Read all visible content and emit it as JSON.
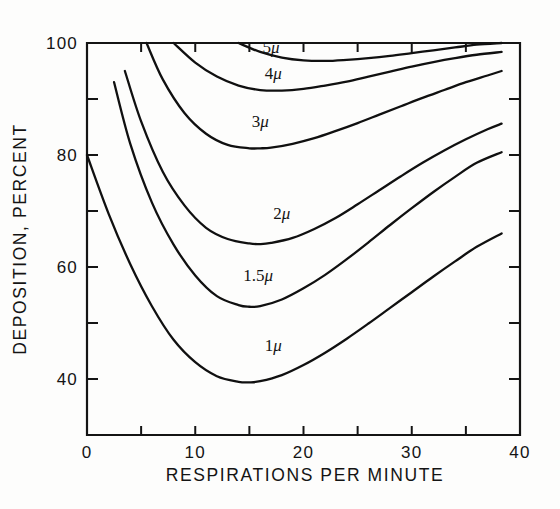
{
  "chart_data": {
    "type": "line",
    "title": "",
    "xlabel": "RESPIRATIONS PER MINUTE",
    "ylabel": "DEPOSITION, PERCENT",
    "xlim": [
      0,
      40
    ],
    "ylim": [
      30,
      100
    ],
    "grid": false,
    "legend_position": "inline-curve-labels",
    "x_major_ticks": [
      0,
      10,
      20,
      30,
      40
    ],
    "x_minor_ticks": [
      5,
      15,
      25,
      35
    ],
    "x_tick_labels": [
      "0",
      "10",
      "20",
      "30",
      "40"
    ],
    "y_major_ticks": [
      40,
      60,
      80,
      100
    ],
    "y_minor_ticks": [
      50,
      70,
      90
    ],
    "y_tick_labels": [
      "40",
      "60",
      "80",
      "100"
    ],
    "series": [
      {
        "name": "1μ",
        "label": "1",
        "unit": "μ",
        "label_x": 17.2,
        "label_y": 45.0,
        "x": [
          0,
          2,
          4,
          6,
          8,
          10,
          12,
          14,
          15,
          16,
          18,
          20,
          22,
          24,
          26,
          28,
          30,
          32,
          34,
          36,
          38.3
        ],
        "y": [
          80.0,
          69.5,
          60.5,
          53.0,
          47.0,
          43.0,
          40.5,
          39.5,
          39.4,
          39.6,
          40.7,
          42.5,
          44.7,
          47.2,
          49.9,
          52.7,
          55.5,
          58.3,
          61.0,
          63.6,
          66.0
        ]
      },
      {
        "name": "1.5μ",
        "label": "1.5",
        "unit": "μ",
        "label_x": 15.8,
        "label_y": 57.5,
        "x": [
          2.5,
          4,
          6,
          8,
          10,
          12,
          14,
          15,
          16,
          18,
          20,
          22,
          24,
          26,
          28,
          30,
          32,
          34,
          36,
          38.3
        ],
        "y": [
          93.0,
          82.0,
          71.5,
          64.0,
          58.5,
          54.8,
          53.2,
          52.9,
          53.0,
          54.2,
          56.2,
          58.6,
          61.4,
          64.4,
          67.5,
          70.5,
          73.4,
          76.1,
          78.6,
          80.5
        ]
      },
      {
        "name": "2μ",
        "label": "2",
        "unit": "μ",
        "label_x": 18.0,
        "label_y": 68.5,
        "x": [
          3.5,
          5,
          7,
          9,
          11,
          13,
          15,
          16,
          17,
          19,
          21,
          23,
          25,
          27,
          29,
          31,
          33,
          35,
          37,
          38.3
        ],
        "y": [
          95.0,
          86.0,
          77.0,
          71.0,
          67.0,
          65.0,
          64.2,
          64.1,
          64.3,
          65.2,
          66.8,
          68.8,
          71.2,
          73.7,
          76.2,
          78.6,
          80.8,
          82.8,
          84.6,
          85.6
        ]
      },
      {
        "name": "3μ",
        "label": "3",
        "unit": "μ",
        "label_x": 16.0,
        "label_y": 85.0,
        "x": [
          5.5,
          7,
          9,
          11,
          13,
          15,
          16,
          17,
          19,
          21,
          23,
          25,
          27,
          29,
          31,
          33,
          35,
          37,
          38.3
        ],
        "y": [
          100.0,
          93.5,
          87.5,
          83.8,
          81.8,
          81.2,
          81.2,
          81.3,
          82.0,
          83.0,
          84.3,
          85.7,
          87.2,
          88.7,
          90.2,
          91.6,
          93.0,
          94.2,
          95.0
        ]
      },
      {
        "name": "4μ",
        "label": "4",
        "unit": "μ",
        "label_x": 17.2,
        "label_y": 93.5,
        "x": [
          8,
          10,
          12,
          14,
          16,
          18,
          20,
          22,
          24,
          26,
          28,
          30,
          32,
          34,
          36,
          38.3
        ],
        "y": [
          100.0,
          96.5,
          94.0,
          92.4,
          91.6,
          91.5,
          91.8,
          92.4,
          93.1,
          94.0,
          94.9,
          95.8,
          96.6,
          97.3,
          97.9,
          98.4
        ]
      },
      {
        "name": "5μ",
        "label": "5",
        "unit": "μ",
        "label_x": 17.0,
        "label_y": 98.3,
        "x": [
          14,
          16,
          18,
          20,
          22,
          24,
          26,
          28,
          30,
          32,
          34,
          36,
          38.3
        ],
        "y": [
          100.0,
          98.4,
          97.4,
          96.9,
          96.8,
          97.0,
          97.3,
          97.7,
          98.2,
          98.7,
          99.2,
          99.7,
          100.0
        ]
      }
    ]
  },
  "figure": {
    "axis_color": "#141414",
    "background": "#ffffff",
    "curve_color": "#101010"
  }
}
